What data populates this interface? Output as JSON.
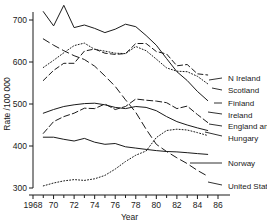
{
  "chart_data": {
    "type": "line",
    "title": "",
    "xlabel": "Year",
    "ylabel": "Rate /100 000",
    "xlim": [
      1968,
      1986
    ],
    "ylim": [
      290,
      745
    ],
    "grid": false,
    "legend_position": "right-inline-labels",
    "xticks": [
      1968,
      1970,
      1972,
      1974,
      1976,
      1978,
      1980,
      1982,
      1984,
      1986
    ],
    "xticklabels": [
      "1968",
      "70",
      "72",
      "74",
      "76",
      "78",
      "80",
      "82",
      "84",
      "86"
    ],
    "yticks": [
      300,
      400,
      500,
      600,
      700
    ],
    "yticklabels": [
      "300",
      "400",
      "500",
      "600",
      "700"
    ],
    "x": [
      1969,
      1970,
      1971,
      1972,
      1973,
      1974,
      1975,
      1976,
      1977,
      1978,
      1979,
      1980,
      1981,
      1982,
      1983,
      1984,
      1985
    ],
    "series": [
      {
        "name": "Finland",
        "label": "Finland",
        "style": "solid",
        "values": [
          720,
          686,
          735,
          682,
          688,
          680,
          670,
          678,
          690,
          684,
          663,
          640,
          608,
          577,
          556,
          530,
          508
        ],
        "label_xy": [
          228,
          103
        ],
        "leader": [
          [
            214,
            103
          ],
          [
            222,
            103
          ]
        ]
      },
      {
        "name": "Scotland",
        "label": "Scotland",
        "style": "dotted",
        "values": [
          587,
          604,
          622,
          639,
          645,
          630,
          626,
          621,
          620,
          637,
          627,
          607,
          586,
          578,
          577,
          566,
          548
        ],
        "label_xy": [
          228,
          90
        ],
        "leader": [
          [
            212,
            88
          ],
          [
            222,
            90
          ]
        ]
      },
      {
        "name": "N Ireland",
        "label": "N Ireland",
        "style": "dashed",
        "values": [
          556,
          580,
          597,
          597,
          626,
          631,
          621,
          618,
          620,
          644,
          644,
          625,
          619,
          591,
          594,
          572,
          569
        ],
        "label_xy": [
          228,
          78
        ],
        "leader": [
          [
            209,
            80
          ],
          [
            222,
            78
          ]
        ]
      },
      {
        "name": "Hungary",
        "label": "Hungary",
        "style": "dashed-heavy",
        "values": [
          655,
          640,
          627,
          615,
          606,
          590,
          567,
          542,
          510,
          480,
          440,
          404,
          387,
          372,
          358,
          342,
          328
        ],
        "label_xy": [
          228,
          138
        ],
        "leader": [
          [
            205,
            132
          ],
          [
            222,
            136
          ]
        ]
      },
      {
        "name": "England and Wales",
        "label": "England and Wales",
        "style": "solid",
        "values": [
          478,
          487,
          494,
          498,
          501,
          502,
          498,
          492,
          489,
          494,
          492,
          484,
          470,
          458,
          450,
          443,
          437
        ],
        "label_xy": [
          228,
          126
        ],
        "leader": [
          [
            209,
            124
          ],
          [
            222,
            126
          ]
        ]
      },
      {
        "name": "Ireland",
        "label": "Ireland",
        "style": "dash-dot",
        "values": [
          430,
          458,
          470,
          478,
          490,
          489,
          500,
          487,
          494,
          512,
          509,
          507,
          503,
          489,
          495,
          475,
          456
        ],
        "label_xy": [
          228,
          115
        ],
        "leader": [
          [
            208,
            112
          ],
          [
            222,
            114
          ]
        ]
      },
      {
        "name": "Norway",
        "label": "Norway",
        "style": "solid",
        "values": [
          421,
          421,
          416,
          412,
          418,
          409,
          404,
          406,
          398,
          395,
          392,
          389,
          387,
          386,
          384,
          382,
          380
        ],
        "label_xy": [
          228,
          163
        ],
        "leader": [
          [
            190,
            163
          ],
          [
            222,
            163
          ]
        ]
      },
      {
        "name": "United States",
        "label": "United States",
        "style": "dotted",
        "values": [
          305,
          312,
          317,
          320,
          318,
          322,
          330,
          345,
          363,
          378,
          388,
          420,
          437,
          440,
          438,
          432,
          425
        ],
        "label_xy": [
          228,
          186
        ],
        "leader": [
          [
            208,
            182
          ],
          [
            222,
            185
          ]
        ]
      }
    ]
  }
}
